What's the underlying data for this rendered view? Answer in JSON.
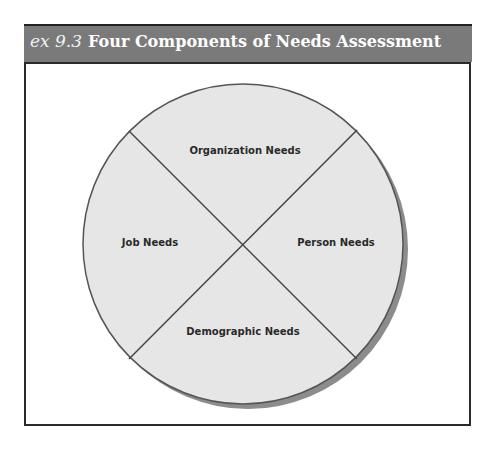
{
  "header": {
    "exhibit_number": "ex 9.3",
    "title": "Four Components of Needs Assessment",
    "background_color": "#7a7a7a"
  },
  "diagram": {
    "type": "quadrant-circle",
    "circle_fill": "#e6e6e6",
    "circle_stroke": "#555555",
    "shadow_color": "#8c8c8c",
    "quadrants": [
      {
        "position": "top",
        "label": "Organization Needs"
      },
      {
        "position": "left",
        "label": "Job Needs"
      },
      {
        "position": "right",
        "label": "Person Needs"
      },
      {
        "position": "bottom",
        "label": "Demographic Needs"
      }
    ]
  }
}
